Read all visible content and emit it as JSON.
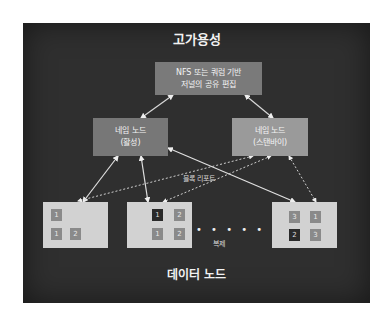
{
  "diagram": {
    "title": "고가용성",
    "shared_storage": {
      "line1": "NFS 또는 쿼럼 기반",
      "line2": "저널의 공유 편집"
    },
    "name_nodes": [
      {
        "line1": "네임 노드",
        "line2": "(활성)"
      },
      {
        "line1": "네임 노드",
        "line2": "(스탠바이)"
      }
    ],
    "edge_labels": {
      "block_report": "블록 리포트",
      "replication": "복제"
    },
    "ellipsis": "• • • • • • • •",
    "data_nodes_label": "데이터 노드",
    "data_nodes": [
      {
        "blocks": [
          {
            "id": "1",
            "pos": "tl"
          },
          {
            "id": "1",
            "pos": "bl"
          },
          {
            "id": "2",
            "pos": "br"
          }
        ]
      },
      {
        "blocks": [
          {
            "id": "1",
            "pos": "tl",
            "dark": true
          },
          {
            "id": "2",
            "pos": "tr"
          },
          {
            "id": "1",
            "pos": "bl"
          },
          {
            "id": "2",
            "pos": "br"
          }
        ]
      },
      {
        "blocks": [
          {
            "id": "3",
            "pos": "tl"
          },
          {
            "id": "1",
            "pos": "tr"
          },
          {
            "id": "2",
            "pos": "bl",
            "dark": true
          },
          {
            "id": "3",
            "pos": "br"
          }
        ]
      }
    ],
    "colors": {
      "background": "#2f2f2f",
      "box_active": "#777777",
      "box_standby": "#9a9a9a",
      "data_node": "#d2d2d2",
      "block": "#8a8a8a",
      "block_dark": "#2a2a2a"
    }
  }
}
